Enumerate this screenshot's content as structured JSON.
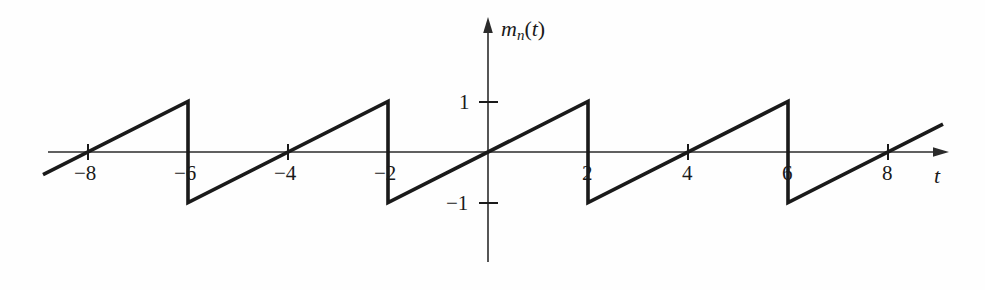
{
  "figure": {
    "background_color": "#fefefe",
    "line_color": "#1a1a1a",
    "axis_color": "#2b2b2b"
  },
  "axes": {
    "y_axis_label": {
      "base": "m",
      "subscript": "n",
      "argument": "(t)",
      "full": "m_n(t)"
    },
    "x_axis_label": "t",
    "x_ticks": [
      {
        "value": -8,
        "label": "−8",
        "px": 88
      },
      {
        "value": -6,
        "label": "−6",
        "px": 188
      },
      {
        "value": -4,
        "label": "−4",
        "px": 288
      },
      {
        "value": -2,
        "label": "−2",
        "px": 388
      },
      {
        "value": 2,
        "label": "2",
        "px": 588
      },
      {
        "value": 4,
        "label": "4",
        "px": 688
      },
      {
        "value": 6,
        "label": "6",
        "px": 788
      },
      {
        "value": 8,
        "label": "8",
        "px": 888
      }
    ],
    "y_ticks": [
      {
        "value": 1,
        "label": "1",
        "px": 102
      },
      {
        "value": -1,
        "label": "−1",
        "px": 203
      }
    ],
    "origin_px": {
      "x": 488,
      "y": 152
    },
    "px_per_unit_x": 50,
    "px_per_unit_y": 50.5
  },
  "chart_data": {
    "type": "line",
    "title": "",
    "subtitle": "",
    "xlabel": "t",
    "ylabel": "m_n(t)",
    "xlim": [
      -8.9,
      9.1
    ],
    "ylim": [
      -1.3,
      1.3
    ],
    "grid": false,
    "legend": null,
    "waveform": {
      "name": "sawtooth",
      "description": "Periodic sawtooth ramp rising linearly from -1 to +1 with period 4, zero crossings at multiples of 4, discontinuous drops at t = 4k+2",
      "period": 4,
      "amplitude": 1,
      "slope_per_unit_t": 0.5,
      "zero_crossings": [
        -8,
        -4,
        0,
        4,
        8
      ],
      "discontinuities": [
        -6,
        -2,
        2,
        6
      ],
      "peak_value": 1,
      "trough_value": -1,
      "visible_t_range": [
        -8.9,
        9.1
      ]
    },
    "segments": [
      {
        "from": {
          "t": -8.9,
          "m": -0.45
        },
        "to": {
          "t": -6.0,
          "m": 1.0
        }
      },
      {
        "from": {
          "t": -6.0,
          "m": 1.0
        },
        "to": {
          "t": -6.0,
          "m": -1.0
        },
        "vertical": true
      },
      {
        "from": {
          "t": -6.0,
          "m": -1.0
        },
        "to": {
          "t": -2.0,
          "m": 1.0
        }
      },
      {
        "from": {
          "t": -2.0,
          "m": 1.0
        },
        "to": {
          "t": -2.0,
          "m": -1.0
        },
        "vertical": true
      },
      {
        "from": {
          "t": -2.0,
          "m": -1.0
        },
        "to": {
          "t": 2.0,
          "m": 1.0
        }
      },
      {
        "from": {
          "t": 2.0,
          "m": 1.0
        },
        "to": {
          "t": 2.0,
          "m": -1.0
        },
        "vertical": true
      },
      {
        "from": {
          "t": 2.0,
          "m": -1.0
        },
        "to": {
          "t": 6.0,
          "m": 1.0
        }
      },
      {
        "from": {
          "t": 6.0,
          "m": 1.0
        },
        "to": {
          "t": 6.0,
          "m": -1.0
        },
        "vertical": true
      },
      {
        "from": {
          "t": 6.0,
          "m": -1.0
        },
        "to": {
          "t": 9.1,
          "m": 0.55
        }
      }
    ],
    "points": [
      {
        "t": -8.9,
        "m": -0.45
      },
      {
        "t": -6.0,
        "m": 1.0
      },
      {
        "t": -6.0,
        "m": -1.0
      },
      {
        "t": -2.0,
        "m": 1.0
      },
      {
        "t": -2.0,
        "m": -1.0
      },
      {
        "t": 2.0,
        "m": 1.0
      },
      {
        "t": 2.0,
        "m": -1.0
      },
      {
        "t": 6.0,
        "m": 1.0
      },
      {
        "t": 6.0,
        "m": -1.0
      },
      {
        "t": 9.1,
        "m": 0.55
      }
    ]
  }
}
